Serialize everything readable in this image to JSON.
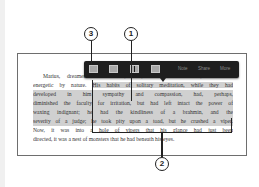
{
  "toolbar": {
    "swatches": [
      "highlight-color-1",
      "highlight-color-2",
      "highlight-color-3",
      "highlight-color-4"
    ],
    "note_label": "Note",
    "share_label": "Share",
    "more_label": "More"
  },
  "callouts": {
    "c1": "1",
    "c2": "2",
    "c3": "3"
  },
  "passage": {
    "lines": [
      "Marius, dreamer as he was, was, as we have said, firm and",
      "energetic by nature. His habits of solitary meditation, while they had",
      "developed in him sympathy and compassion, had, perhaps,",
      "diminished the faculty for irritation, but had left intact the power of",
      "waxing indignant; he had the kindliness of a brahmin, and the",
      "severity of a judge; he took pity upon a toad, but he crushed a viper.",
      "Now, it was into a hole of vipers that his glance had just been",
      "directed, it was a nest of monsters that he had beneath his eyes."
    ],
    "line2_prefix": "energetic by nature. ",
    "line2_hl": "His habits of solitary meditation, while they had"
  },
  "colors": {
    "toolbar_bg": "#1e1e1e",
    "highlight": "#d0d0d0",
    "swatch": "#a8a8a8"
  }
}
